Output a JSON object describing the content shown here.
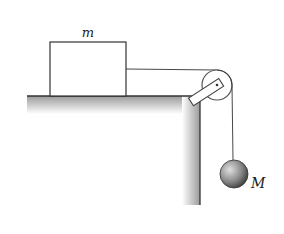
{
  "diagram": {
    "type": "physics-pulley-system",
    "labels": {
      "block_mass": "m",
      "hanging_mass": "M"
    },
    "elements": {
      "block": {
        "x": 50,
        "y": 42,
        "width": 76,
        "height": 54
      },
      "table_top_y": 96,
      "table_left_x": 27,
      "table_edge_x": 200,
      "table_bottom_y": 205,
      "pulley": {
        "cx": 217,
        "cy": 85,
        "r": 15
      },
      "hanging_ball": {
        "cx": 234,
        "cy": 174,
        "r": 14
      }
    },
    "colors": {
      "stroke": "#333333",
      "shade_dark": "#9a9a9a",
      "ball_light": "#d9d9d9",
      "ball_dark": "#4a4a4a"
    }
  }
}
